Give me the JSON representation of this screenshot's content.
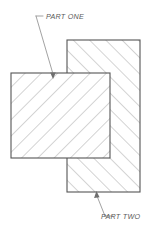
{
  "drawing": {
    "title": "Two-part section view",
    "background_color": "#ffffff",
    "outline_color": "#555555",
    "hatch_color": "#8c8c8c",
    "leader_color": "#8a8a8a",
    "text_color": "#5a5a5a",
    "canvas": {
      "width": 150,
      "height": 239
    },
    "parts": [
      {
        "id": "part-one",
        "label": "PART ONE",
        "shape": "rectangle",
        "x": 11,
        "y": 73,
        "width": 99,
        "height": 85,
        "hatch_direction": "backslash",
        "hatch_angle_deg": 45,
        "hatch_spacing": 11.5,
        "draw_order": 2,
        "leader": {
          "text_anchor_x": 44,
          "text_anchor_y": 16,
          "dash_start_x": 36,
          "dash_start_y": 16,
          "elbow_x": 43,
          "elbow_y": 16,
          "arrow_x": 53,
          "arrow_y": 78,
          "label_x": 46,
          "label_y": 19
        }
      },
      {
        "id": "part-two",
        "label": "PART TWO",
        "shape": "rectangle",
        "x": 67,
        "y": 40,
        "width": 73,
        "height": 152,
        "hatch_direction": "slash",
        "hatch_angle_deg": 135,
        "hatch_spacing": 11.5,
        "draw_order": 1,
        "leader": {
          "arrow_x": 97,
          "arrow_y": 192,
          "elbow_x": 105,
          "elbow_y": 216,
          "dash_end_x": 113,
          "dash_end_y": 216,
          "label_x": 101,
          "label_y": 219
        }
      }
    ],
    "labels": [
      {
        "name": "part-one-label",
        "text": "PART ONE"
      },
      {
        "name": "part-two-label",
        "text": "PART TWO"
      }
    ]
  }
}
